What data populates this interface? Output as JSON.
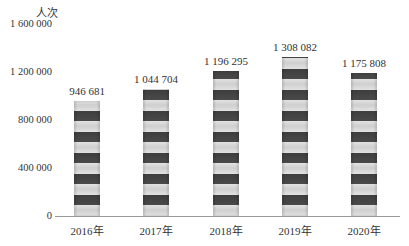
{
  "chart_data": {
    "type": "bar",
    "title": "",
    "ylabel": "人次",
    "xlabel": "",
    "categories": [
      "2016年",
      "2017年",
      "2018年",
      "2019年",
      "2020年"
    ],
    "values": [
      946681,
      1044704,
      1196295,
      1308082,
      1175808
    ],
    "value_labels": [
      "946 681",
      "1 044 704",
      "1 196 295",
      "1 308 082",
      "1 175 808"
    ],
    "yticks": [
      "0",
      "400 000",
      "800 000",
      "1 200 000",
      "1 600 000"
    ],
    "ylim": [
      0,
      1600000
    ],
    "grid": false,
    "legend": null
  }
}
